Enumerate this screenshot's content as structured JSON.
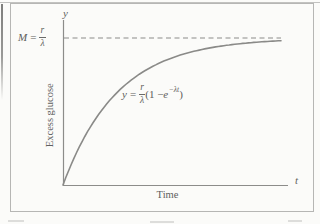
{
  "figure": {
    "y_axis_symbol": "y",
    "x_axis_symbol": "t",
    "y_axis_title": "Excess glucose",
    "x_axis_title": "Time",
    "asymptote_label": {
      "lhs": "M",
      "eq": "=",
      "num": "r",
      "den": "λ"
    },
    "equation_label": {
      "lhs": "y",
      "eq": "=",
      "num": "r",
      "den": "λ",
      "pre": "(1 − ",
      "base": "e",
      "sup": "−λt",
      "post": ")"
    }
  },
  "colors": {
    "paper": "#fbfbf9",
    "frame_border": "#b6b6b4",
    "line_gray": "#8e8e8c",
    "text_gray": "#5a5a58"
  },
  "chart_data": {
    "type": "line",
    "title": "",
    "xlabel": "Time",
    "ylabel": "Excess glucose",
    "x_axis_symbol": "t",
    "y_axis_symbol": "y",
    "equation": "y = (r/λ)(1 − e^(−λt))",
    "asymptote": {
      "label": "M = r/λ",
      "value": 1,
      "style": "dashed"
    },
    "axes_quantitative": false,
    "grid": false,
    "legend": "none",
    "params": {
      "M": 1,
      "lambda": 1,
      "t_min": 0,
      "t_max": 4
    },
    "x": [
      0,
      0.25,
      0.5,
      0.75,
      1,
      1.25,
      1.5,
      1.75,
      2,
      2.25,
      2.5,
      2.75,
      3,
      3.25,
      3.5,
      3.75,
      4
    ],
    "series": [
      {
        "name": "excess glucose y(t)",
        "values": [
          0,
          0.221,
          0.393,
          0.528,
          0.632,
          0.713,
          0.777,
          0.826,
          0.865,
          0.895,
          0.918,
          0.936,
          0.95,
          0.961,
          0.97,
          0.976,
          0.982
        ]
      }
    ]
  }
}
